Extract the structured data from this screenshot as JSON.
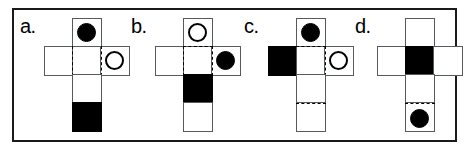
{
  "figure": {
    "frame_color": "#1a1a1a",
    "fill_color": "#000000",
    "line_color": "#555a5e",
    "background_color": "#ffffff"
  },
  "panels": [
    {
      "id": "a",
      "label": "a.",
      "faces": {
        "top": {
          "fill": "white",
          "marker": "filled-circle"
        },
        "left": {
          "fill": "white",
          "marker": "none"
        },
        "center": {
          "fill": "white",
          "marker": "none"
        },
        "right": {
          "fill": "white",
          "marker": "open-circle"
        },
        "bottom_1": {
          "fill": "white",
          "marker": "none"
        },
        "bottom_2": {
          "fill": "black",
          "marker": "none"
        }
      }
    },
    {
      "id": "b",
      "label": "b.",
      "faces": {
        "top": {
          "fill": "white",
          "marker": "open-circle"
        },
        "left": {
          "fill": "white",
          "marker": "none"
        },
        "center": {
          "fill": "white",
          "marker": "none"
        },
        "right": {
          "fill": "white",
          "marker": "filled-circle"
        },
        "bottom_1": {
          "fill": "black",
          "marker": "none"
        },
        "bottom_2": {
          "fill": "white",
          "marker": "none"
        }
      }
    },
    {
      "id": "c",
      "label": "c.",
      "faces": {
        "top": {
          "fill": "white",
          "marker": "filled-circle"
        },
        "left": {
          "fill": "black",
          "marker": "none"
        },
        "center": {
          "fill": "white",
          "marker": "none"
        },
        "right": {
          "fill": "white",
          "marker": "open-circle"
        },
        "bottom_1": {
          "fill": "white",
          "marker": "none"
        },
        "bottom_2": {
          "fill": "white",
          "marker": "none"
        }
      }
    },
    {
      "id": "d",
      "label": "d.",
      "faces": {
        "top": {
          "fill": "white",
          "marker": "none"
        },
        "left": {
          "fill": "white",
          "marker": "none"
        },
        "center": {
          "fill": "black",
          "marker": "none"
        },
        "right": {
          "fill": "white",
          "marker": "none"
        },
        "bottom_1": {
          "fill": "white",
          "marker": "none"
        },
        "bottom_2": {
          "fill": "white",
          "marker": "filled-circle"
        }
      }
    }
  ]
}
